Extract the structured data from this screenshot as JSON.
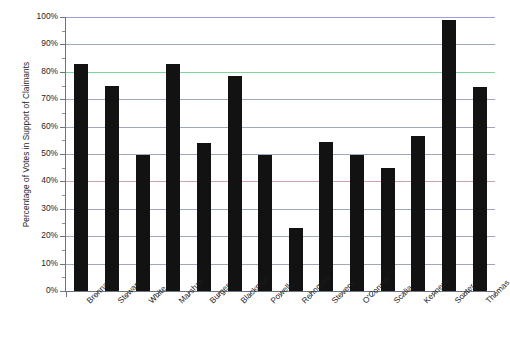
{
  "chart_data": {
    "type": "bar",
    "title": "",
    "subtitle": "",
    "xlabel": "",
    "ylabel": "Percentage of Votes in Support of Claimants",
    "ylim": [
      0,
      100
    ],
    "ytick_labels": [
      "100%",
      "90%",
      "80%",
      "70%",
      "60%",
      "50%",
      "40%",
      "30%",
      "20%",
      "10%",
      "0%"
    ],
    "ytick_values": [
      100,
      90,
      80,
      70,
      60,
      50,
      40,
      30,
      20,
      10,
      0
    ],
    "grid": true,
    "legend": "none",
    "categories": [
      "Brennan",
      "Stewart",
      "White",
      "Marshall",
      "Burger",
      "Blackmun",
      "Powell",
      "Rehnquist",
      "Stevens",
      "O'Connor",
      "Scalia",
      "Kennedy",
      "Souter",
      "Thomas"
    ],
    "values": [
      83,
      75,
      49.5,
      83,
      54,
      78.5,
      49.5,
      23,
      54.5,
      49.5,
      45,
      56.5,
      99,
      74.5
    ],
    "series": [
      {
        "name": "Percentage of Votes in Support of Claimants",
        "values": [
          83,
          75,
          49.5,
          83,
          54,
          78.5,
          49.5,
          23,
          54.5,
          49.5,
          45,
          56.5,
          99,
          74.5
        ]
      }
    ],
    "bar_color": "#121212",
    "gridline_colors": {
      "100": "#9a9ede",
      "80": "#79d79b",
      "40": "#d2a0b4",
      "default": "#9fa8ba"
    }
  }
}
